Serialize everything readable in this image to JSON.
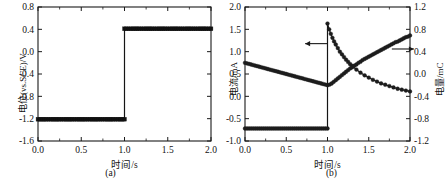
{
  "figure": {
    "panel_a_caption": "(a)",
    "panel_b_caption": "(b)"
  },
  "chart_data": [
    {
      "type": "line",
      "panel": "a",
      "title": "",
      "xlabel": "时间/s",
      "ylabel": "电位(vs.SCE)/V",
      "xlim": [
        0.0,
        2.0
      ],
      "ylim": [
        -1.6,
        0.8
      ],
      "xticks": [
        "0.0",
        "0.5",
        "1.0",
        "1.5",
        "2.0"
      ],
      "xtick_values": [
        0.0,
        0.5,
        1.0,
        1.5,
        2.0
      ],
      "yticks": [
        "0.8",
        "0.4",
        "0.0",
        "-0.4",
        "-0.8",
        "-1.2",
        "-1.6"
      ],
      "ytick_values": [
        0.8,
        0.4,
        0.0,
        -0.4,
        -0.8,
        -1.2,
        -1.6
      ],
      "grid": false,
      "legend": "none",
      "marker": "filled-square",
      "series": [
        {
          "name": "电位(vs.SCE)/V",
          "axis": "left",
          "x": [
            0.0,
            0.025,
            0.05,
            0.075,
            0.1,
            0.125,
            0.15,
            0.175,
            0.2,
            0.225,
            0.25,
            0.275,
            0.3,
            0.325,
            0.35,
            0.375,
            0.4,
            0.425,
            0.45,
            0.475,
            0.5,
            0.525,
            0.55,
            0.575,
            0.6,
            0.625,
            0.65,
            0.675,
            0.7,
            0.725,
            0.75,
            0.775,
            0.8,
            0.825,
            0.85,
            0.875,
            0.9,
            0.925,
            0.95,
            0.975,
            1.0,
            1.0,
            1.025,
            1.05,
            1.075,
            1.1,
            1.125,
            1.15,
            1.175,
            1.2,
            1.225,
            1.25,
            1.275,
            1.3,
            1.325,
            1.35,
            1.375,
            1.4,
            1.425,
            1.45,
            1.475,
            1.5,
            1.525,
            1.55,
            1.575,
            1.6,
            1.625,
            1.65,
            1.675,
            1.7,
            1.725,
            1.75,
            1.775,
            1.8,
            1.825,
            1.85,
            1.875,
            1.9,
            1.925,
            1.95,
            1.975,
            2.0
          ],
          "values": [
            -1.21,
            -1.21,
            -1.21,
            -1.21,
            -1.21,
            -1.21,
            -1.21,
            -1.21,
            -1.21,
            -1.21,
            -1.21,
            -1.21,
            -1.21,
            -1.21,
            -1.21,
            -1.21,
            -1.21,
            -1.21,
            -1.21,
            -1.21,
            -1.21,
            -1.21,
            -1.21,
            -1.21,
            -1.21,
            -1.21,
            -1.21,
            -1.21,
            -1.21,
            -1.21,
            -1.21,
            -1.21,
            -1.21,
            -1.21,
            -1.21,
            -1.21,
            -1.21,
            -1.21,
            -1.21,
            -1.21,
            -1.21,
            0.41,
            0.41,
            0.41,
            0.41,
            0.41,
            0.41,
            0.41,
            0.41,
            0.41,
            0.41,
            0.41,
            0.41,
            0.41,
            0.41,
            0.41,
            0.41,
            0.41,
            0.41,
            0.41,
            0.41,
            0.41,
            0.41,
            0.41,
            0.41,
            0.41,
            0.41,
            0.41,
            0.41,
            0.41,
            0.41,
            0.41,
            0.41,
            0.41,
            0.41,
            0.41,
            0.41,
            0.41,
            0.41,
            0.41,
            0.41,
            0.41
          ]
        }
      ]
    },
    {
      "type": "line",
      "panel": "b",
      "title": "",
      "xlabel": "时间/s",
      "ylabel": "电流/mA",
      "ylabel_right": "电量/mC",
      "xlim": [
        0.0,
        2.0
      ],
      "ylim": [
        -1.0,
        2.0
      ],
      "ylim_right": [
        -1.2,
        1.2
      ],
      "xticks": [
        "0.0",
        "0.5",
        "1.0",
        "1.5",
        "2.0"
      ],
      "xtick_values": [
        0.0,
        0.5,
        1.0,
        1.5,
        2.0
      ],
      "yticks": [
        "2.0",
        "1.5",
        "1.0",
        "0.5",
        "0.0",
        "-0.5",
        "-1.0"
      ],
      "ytick_values": [
        2.0,
        1.5,
        1.0,
        0.5,
        0.0,
        -0.5,
        -1.0
      ],
      "yticks_right": [
        "1.2",
        "0.8",
        "0.4",
        "0.0",
        "-0.4",
        "-0.8",
        "-1.2"
      ],
      "ytick_values_right": [
        1.2,
        0.8,
        0.4,
        0.0,
        -0.4,
        -0.8,
        -1.2
      ],
      "grid": false,
      "legend": "none",
      "marker": "filled-circle",
      "annotations": [
        {
          "name": "left-axis-arrow",
          "glyph": "←",
          "x": 1.02,
          "y": 1.18
        },
        {
          "name": "right-axis-arrow",
          "glyph": "→",
          "x": 1.78,
          "y": 1.06
        }
      ],
      "series": [
        {
          "name": "电流/mA",
          "axis": "left",
          "x": [
            0.0,
            0.025,
            0.05,
            0.075,
            0.1,
            0.125,
            0.15,
            0.175,
            0.2,
            0.225,
            0.25,
            0.275,
            0.3,
            0.325,
            0.35,
            0.375,
            0.4,
            0.425,
            0.45,
            0.475,
            0.5,
            0.525,
            0.55,
            0.575,
            0.6,
            0.625,
            0.65,
            0.675,
            0.7,
            0.725,
            0.75,
            0.775,
            0.8,
            0.825,
            0.85,
            0.875,
            0.9,
            0.925,
            0.95,
            0.975,
            1.0,
            1.0,
            1.02,
            1.04,
            1.06,
            1.08,
            1.1,
            1.125,
            1.15,
            1.175,
            1.2,
            1.225,
            1.25,
            1.275,
            1.3,
            1.35,
            1.4,
            1.45,
            1.5,
            1.55,
            1.6,
            1.65,
            1.7,
            1.75,
            1.8,
            1.85,
            1.9,
            1.95,
            2.0
          ],
          "values": [
            -0.72,
            -0.72,
            -0.72,
            -0.72,
            -0.72,
            -0.72,
            -0.72,
            -0.72,
            -0.72,
            -0.72,
            -0.72,
            -0.72,
            -0.72,
            -0.72,
            -0.72,
            -0.72,
            -0.72,
            -0.72,
            -0.72,
            -0.72,
            -0.72,
            -0.72,
            -0.72,
            -0.72,
            -0.72,
            -0.72,
            -0.72,
            -0.72,
            -0.72,
            -0.72,
            -0.72,
            -0.72,
            -0.72,
            -0.72,
            -0.72,
            -0.72,
            -0.72,
            -0.72,
            -0.72,
            -0.72,
            -0.72,
            1.63,
            1.5,
            1.4,
            1.31,
            1.23,
            1.16,
            1.08,
            1.0,
            0.94,
            0.88,
            0.82,
            0.77,
            0.72,
            0.68,
            0.6,
            0.53,
            0.47,
            0.42,
            0.37,
            0.33,
            0.29,
            0.26,
            0.23,
            0.2,
            0.17,
            0.15,
            0.13,
            0.11
          ]
        },
        {
          "name": "电量/mC",
          "axis": "right",
          "x": [
            0.0,
            0.025,
            0.05,
            0.075,
            0.1,
            0.125,
            0.15,
            0.175,
            0.2,
            0.225,
            0.25,
            0.275,
            0.3,
            0.325,
            0.35,
            0.375,
            0.4,
            0.425,
            0.45,
            0.475,
            0.5,
            0.525,
            0.55,
            0.575,
            0.6,
            0.625,
            0.65,
            0.675,
            0.7,
            0.725,
            0.75,
            0.775,
            0.8,
            0.825,
            0.85,
            0.875,
            0.9,
            0.925,
            0.95,
            0.975,
            1.0,
            1.025,
            1.05,
            1.075,
            1.1,
            1.125,
            1.15,
            1.175,
            1.2,
            1.225,
            1.25,
            1.275,
            1.3,
            1.325,
            1.35,
            1.375,
            1.4,
            1.425,
            1.45,
            1.475,
            1.5,
            1.525,
            1.55,
            1.575,
            1.6,
            1.625,
            1.65,
            1.675,
            1.7,
            1.725,
            1.75,
            1.775,
            1.8,
            1.825,
            1.85,
            1.875,
            1.9,
            1.925,
            1.95,
            1.975,
            2.0
          ],
          "values": [
            0.2,
            0.19,
            0.18,
            0.17,
            0.16,
            0.15,
            0.14,
            0.13,
            0.12,
            0.11,
            0.1,
            0.09,
            0.08,
            0.07,
            0.06,
            0.05,
            0.04,
            0.03,
            0.02,
            0.01,
            0.0,
            -0.01,
            -0.02,
            -0.03,
            -0.04,
            -0.05,
            -0.06,
            -0.07,
            -0.08,
            -0.09,
            -0.1,
            -0.11,
            -0.12,
            -0.13,
            -0.14,
            -0.15,
            -0.16,
            -0.17,
            -0.18,
            -0.19,
            -0.2,
            -0.19,
            -0.17,
            -0.14,
            -0.11,
            -0.08,
            -0.05,
            -0.02,
            0.01,
            0.04,
            0.07,
            0.1,
            0.12,
            0.15,
            0.17,
            0.2,
            0.22,
            0.25,
            0.27,
            0.29,
            0.31,
            0.33,
            0.35,
            0.37,
            0.39,
            0.41,
            0.43,
            0.45,
            0.47,
            0.49,
            0.51,
            0.53,
            0.55,
            0.57,
            0.58,
            0.6,
            0.62,
            0.64,
            0.66,
            0.67,
            0.69
          ]
        }
      ]
    }
  ]
}
